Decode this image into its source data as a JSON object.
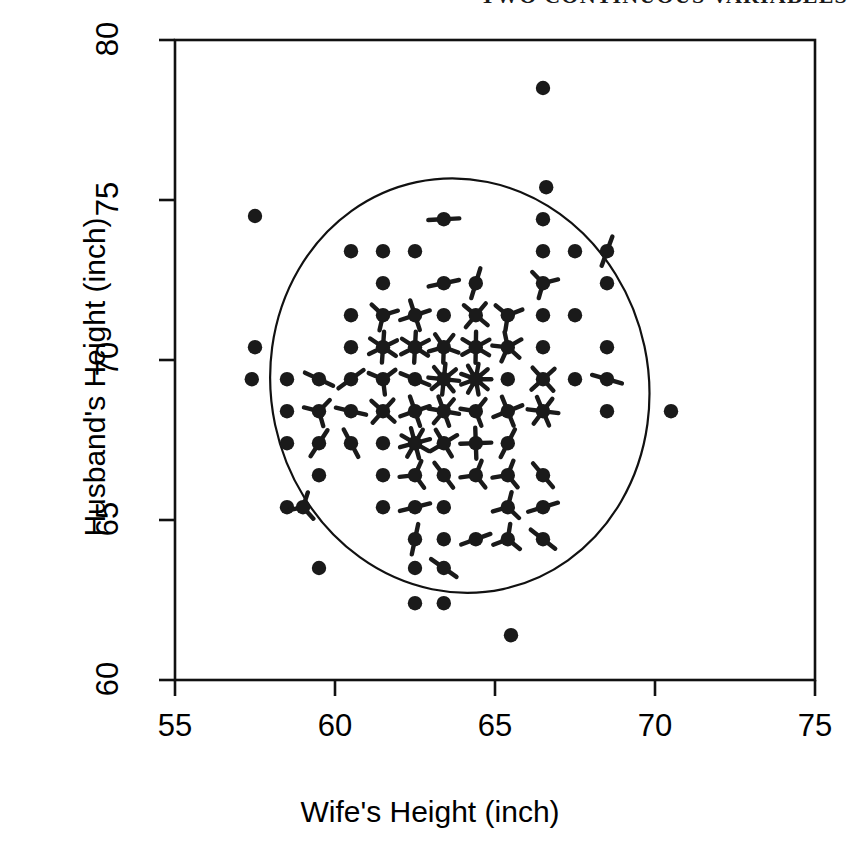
{
  "header": {
    "text": "TWO CONTINUOUS VARIABLES"
  },
  "axes": {
    "x_title": "Wife's Height (inch)",
    "y_title": "Husband's Height (inch)",
    "x_ticks": [
      "55",
      "60",
      "65",
      "70",
      "75"
    ],
    "y_ticks": [
      "60",
      "65",
      "70",
      "75",
      "80"
    ]
  },
  "chart_data": {
    "type": "scatter",
    "variant": "sunflower-plot",
    "title": "",
    "xlabel": "Wife's Height (inch)",
    "ylabel": "Husband's Height (inch)",
    "xlim": [
      55,
      75
    ],
    "ylim": [
      60,
      80
    ],
    "xticks": [
      55,
      60,
      65,
      70,
      75
    ],
    "yticks": [
      60,
      65,
      70,
      75,
      80
    ],
    "grid": false,
    "legend": null,
    "annotations": [
      "Each symbol is a sunflower: number of petals equals the number of coincident observations; a plain dot means a single observation.",
      "A smooth closed ellipse-like contour encloses the central bulk of the data."
    ],
    "contour_ellipse": {
      "center_x": 63.9,
      "center_y": 69.2,
      "radius_x": 5.9,
      "radius_y": 6.5,
      "rotation_deg": -12
    },
    "marker_color": "#1a1a1a",
    "points": [
      {
        "x": 66.5,
        "y": 78.5,
        "n": 1
      },
      {
        "x": 66.6,
        "y": 75.4,
        "n": 1
      },
      {
        "x": 57.5,
        "y": 74.5,
        "n": 1
      },
      {
        "x": 63.4,
        "y": 74.4,
        "n": 2
      },
      {
        "x": 66.5,
        "y": 74.4,
        "n": 1
      },
      {
        "x": 60.5,
        "y": 73.4,
        "n": 1
      },
      {
        "x": 61.5,
        "y": 73.4,
        "n": 1
      },
      {
        "x": 62.5,
        "y": 73.4,
        "n": 1
      },
      {
        "x": 66.5,
        "y": 73.4,
        "n": 1
      },
      {
        "x": 67.5,
        "y": 73.4,
        "n": 1
      },
      {
        "x": 68.5,
        "y": 73.4,
        "n": 2
      },
      {
        "x": 61.5,
        "y": 72.4,
        "n": 1
      },
      {
        "x": 63.4,
        "y": 72.4,
        "n": 2
      },
      {
        "x": 64.4,
        "y": 72.4,
        "n": 2
      },
      {
        "x": 66.5,
        "y": 72.4,
        "n": 3
      },
      {
        "x": 68.5,
        "y": 72.4,
        "n": 1
      },
      {
        "x": 60.5,
        "y": 71.4,
        "n": 1
      },
      {
        "x": 61.5,
        "y": 71.4,
        "n": 3
      },
      {
        "x": 62.5,
        "y": 71.4,
        "n": 4
      },
      {
        "x": 63.4,
        "y": 71.4,
        "n": 1
      },
      {
        "x": 64.4,
        "y": 71.4,
        "n": 4
      },
      {
        "x": 65.4,
        "y": 71.4,
        "n": 3
      },
      {
        "x": 66.5,
        "y": 71.4,
        "n": 1
      },
      {
        "x": 67.5,
        "y": 71.4,
        "n": 1
      },
      {
        "x": 57.5,
        "y": 70.4,
        "n": 1
      },
      {
        "x": 60.5,
        "y": 70.4,
        "n": 1
      },
      {
        "x": 61.5,
        "y": 70.4,
        "n": 6
      },
      {
        "x": 62.5,
        "y": 70.4,
        "n": 6
      },
      {
        "x": 63.4,
        "y": 70.4,
        "n": 5
      },
      {
        "x": 64.4,
        "y": 70.4,
        "n": 6
      },
      {
        "x": 65.4,
        "y": 70.4,
        "n": 5
      },
      {
        "x": 66.5,
        "y": 70.4,
        "n": 1
      },
      {
        "x": 68.5,
        "y": 70.4,
        "n": 1
      },
      {
        "x": 57.4,
        "y": 69.4,
        "n": 1
      },
      {
        "x": 58.5,
        "y": 69.4,
        "n": 1
      },
      {
        "x": 59.5,
        "y": 69.4,
        "n": 2
      },
      {
        "x": 60.5,
        "y": 69.4,
        "n": 2
      },
      {
        "x": 61.5,
        "y": 69.4,
        "n": 3
      },
      {
        "x": 62.5,
        "y": 69.4,
        "n": 2
      },
      {
        "x": 63.4,
        "y": 69.4,
        "n": 8
      },
      {
        "x": 64.4,
        "y": 69.4,
        "n": 9
      },
      {
        "x": 65.4,
        "y": 69.4,
        "n": 1
      },
      {
        "x": 66.5,
        "y": 69.4,
        "n": 4
      },
      {
        "x": 67.5,
        "y": 69.4,
        "n": 1
      },
      {
        "x": 68.5,
        "y": 69.4,
        "n": 2
      },
      {
        "x": 58.5,
        "y": 68.4,
        "n": 1
      },
      {
        "x": 59.5,
        "y": 68.4,
        "n": 3
      },
      {
        "x": 60.5,
        "y": 68.4,
        "n": 2
      },
      {
        "x": 61.5,
        "y": 68.4,
        "n": 4
      },
      {
        "x": 62.5,
        "y": 68.4,
        "n": 4
      },
      {
        "x": 63.4,
        "y": 68.4,
        "n": 6
      },
      {
        "x": 64.4,
        "y": 68.4,
        "n": 3
      },
      {
        "x": 65.4,
        "y": 68.4,
        "n": 4
      },
      {
        "x": 66.5,
        "y": 68.4,
        "n": 6
      },
      {
        "x": 68.5,
        "y": 68.4,
        "n": 1
      },
      {
        "x": 70.5,
        "y": 68.4,
        "n": 1
      },
      {
        "x": 58.5,
        "y": 67.4,
        "n": 1
      },
      {
        "x": 59.5,
        "y": 67.4,
        "n": 2
      },
      {
        "x": 60.5,
        "y": 67.4,
        "n": 2
      },
      {
        "x": 61.5,
        "y": 67.4,
        "n": 1
      },
      {
        "x": 62.5,
        "y": 67.4,
        "n": 8
      },
      {
        "x": 63.4,
        "y": 67.4,
        "n": 4
      },
      {
        "x": 64.4,
        "y": 67.4,
        "n": 4
      },
      {
        "x": 65.4,
        "y": 67.4,
        "n": 2
      },
      {
        "x": 59.5,
        "y": 66.4,
        "n": 1
      },
      {
        "x": 61.5,
        "y": 66.4,
        "n": 1
      },
      {
        "x": 62.5,
        "y": 66.4,
        "n": 3
      },
      {
        "x": 63.4,
        "y": 66.4,
        "n": 2
      },
      {
        "x": 64.4,
        "y": 66.4,
        "n": 3
      },
      {
        "x": 65.4,
        "y": 66.4,
        "n": 3
      },
      {
        "x": 66.5,
        "y": 66.4,
        "n": 2
      },
      {
        "x": 58.5,
        "y": 65.4,
        "n": 1
      },
      {
        "x": 59.0,
        "y": 65.4,
        "n": 3
      },
      {
        "x": 61.5,
        "y": 65.4,
        "n": 1
      },
      {
        "x": 62.5,
        "y": 65.4,
        "n": 2
      },
      {
        "x": 63.4,
        "y": 65.4,
        "n": 1
      },
      {
        "x": 65.4,
        "y": 65.4,
        "n": 3
      },
      {
        "x": 66.5,
        "y": 65.4,
        "n": 2
      },
      {
        "x": 62.5,
        "y": 64.4,
        "n": 2
      },
      {
        "x": 63.4,
        "y": 64.4,
        "n": 1
      },
      {
        "x": 64.4,
        "y": 64.4,
        "n": 2
      },
      {
        "x": 65.4,
        "y": 64.4,
        "n": 3
      },
      {
        "x": 66.5,
        "y": 64.4,
        "n": 2
      },
      {
        "x": 59.5,
        "y": 63.5,
        "n": 1
      },
      {
        "x": 62.5,
        "y": 63.5,
        "n": 1
      },
      {
        "x": 63.4,
        "y": 63.5,
        "n": 2
      },
      {
        "x": 62.5,
        "y": 62.4,
        "n": 1
      },
      {
        "x": 63.4,
        "y": 62.4,
        "n": 1
      },
      {
        "x": 65.5,
        "y": 61.4,
        "n": 1
      }
    ]
  }
}
